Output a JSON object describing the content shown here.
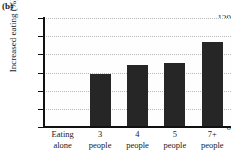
{
  "panel": {
    "label": "(b)"
  },
  "chart_data": {
    "type": "bar",
    "title": "",
    "subtitle": "",
    "xlabel": "",
    "ylabel": "Increased eating (%)",
    "categories": [
      "Eating alone",
      "3 people",
      "4 people",
      "5 people",
      "7+ people"
    ],
    "category_lines": [
      [
        "Eating",
        "alone"
      ],
      [
        "3",
        "people"
      ],
      [
        "4",
        "people"
      ],
      [
        "5",
        "people"
      ],
      [
        "7+",
        "people"
      ]
    ],
    "values": [
      0,
      58,
      68,
      70,
      94
    ],
    "ylim": [
      0,
      120
    ],
    "yticks": [
      0,
      20,
      40,
      60,
      80,
      100,
      120
    ],
    "ytick_labels": [
      "0",
      "20",
      "40",
      "60",
      "80",
      "100",
      "120"
    ],
    "grid": true,
    "grid_axis": "y",
    "legend": false,
    "legend_position": "none",
    "bar_color": "#262626",
    "grid_color": "#b9b9b9",
    "axis_color": "#111111",
    "plot_background": "#fefefe"
  }
}
